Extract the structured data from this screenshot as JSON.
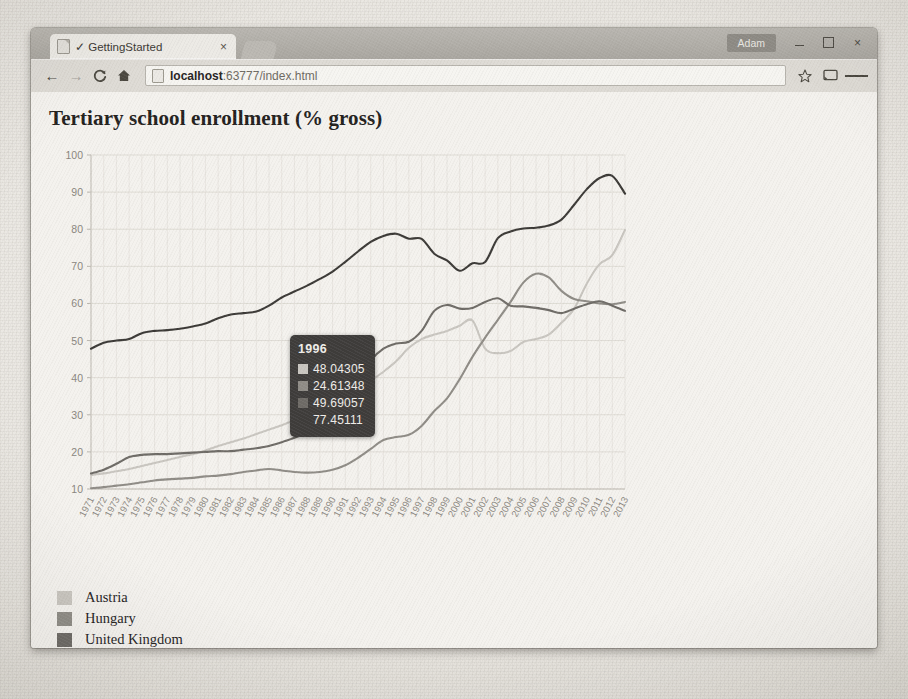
{
  "window": {
    "user_label": "Adam",
    "minimize_label": "minimize",
    "maximize_label": "maximize",
    "close_label": "×"
  },
  "tab": {
    "title": "✓ GettingStarted",
    "close_label": "×"
  },
  "toolbar": {
    "back_label": "←",
    "forward_label": "→",
    "reload_label": "C",
    "home_label": "home",
    "url_prefix": "localhost",
    "url_suffix": ":63777/index.html",
    "url_full": "localhost:63777/index.html",
    "bookmark_label": "☆",
    "cast_label": "cast",
    "menu_label": "menu"
  },
  "chart_data": {
    "type": "line",
    "title": "Tertiary school enrollment (% gross)",
    "xlabel": "",
    "ylabel": "",
    "ylim": [
      10,
      100
    ],
    "yticks": [
      10,
      20,
      30,
      40,
      50,
      60,
      70,
      80,
      90,
      100
    ],
    "grid": true,
    "legend_position": "below-left",
    "x": [
      1971,
      1972,
      1973,
      1974,
      1975,
      1976,
      1977,
      1978,
      1979,
      1980,
      1981,
      1982,
      1983,
      1984,
      1985,
      1986,
      1987,
      1988,
      1989,
      1990,
      1991,
      1992,
      1993,
      1994,
      1995,
      1996,
      1997,
      1998,
      1999,
      2000,
      2001,
      2002,
      2003,
      2004,
      2005,
      2006,
      2007,
      2008,
      2009,
      2010,
      2011,
      2012,
      2013
    ],
    "xticks": [
      "1971",
      "1972",
      "1973",
      "1974",
      "1975",
      "1976",
      "1977",
      "1978",
      "1979",
      "1980",
      "1981",
      "1982",
      "1983",
      "1984",
      "1985",
      "1986",
      "1987",
      "1988",
      "1989",
      "1990",
      "1991",
      "1992",
      "1993",
      "1994",
      "1995",
      "1996",
      "1997",
      "1998",
      "1999",
      "2000",
      "2001",
      "2002",
      "2003",
      "2004",
      "2005",
      "2006",
      "2007",
      "2008",
      "2009",
      "2010",
      "2011",
      "2012",
      "2013"
    ],
    "series": [
      {
        "name": "Austria",
        "color": "#c9c6c0",
        "values": [
          13.8,
          14.2,
          14.8,
          15.4,
          16.2,
          17.0,
          17.8,
          18.6,
          19.4,
          20.4,
          21.6,
          22.6,
          23.6,
          24.8,
          26.0,
          27.2,
          28.6,
          30.2,
          31.6,
          33.2,
          35.0,
          37.0,
          39.2,
          41.6,
          44.4,
          48.04305,
          50.4,
          51.6,
          52.6,
          54.0,
          55.4,
          47.8,
          46.6,
          47.2,
          49.6,
          50.4,
          51.6,
          54.8,
          58.6,
          65.4,
          70.6,
          73.0,
          79.8
        ]
      },
      {
        "name": "Hungary",
        "color": "#8f8c86",
        "values": [
          10.2,
          10.5,
          10.9,
          11.3,
          11.8,
          12.3,
          12.6,
          12.8,
          13.0,
          13.4,
          13.6,
          14.0,
          14.6,
          15.0,
          15.4,
          15.0,
          14.6,
          14.4,
          14.6,
          15.2,
          16.4,
          18.4,
          20.8,
          23.2,
          24.0,
          24.61348,
          27.0,
          31.0,
          34.4,
          39.6,
          45.6,
          50.8,
          55.6,
          60.4,
          65.6,
          68.0,
          67.0,
          63.4,
          61.2,
          60.6,
          60.0,
          59.8,
          60.4
        ]
      },
      {
        "name": "United Kingdom",
        "color": "#6e6b66",
        "values": [
          14.2,
          15.2,
          16.8,
          18.6,
          19.2,
          19.4,
          19.4,
          19.6,
          19.8,
          20.0,
          20.2,
          20.2,
          20.6,
          21.0,
          21.6,
          22.6,
          23.8,
          25.2,
          27.0,
          29.4,
          33.6,
          39.2,
          44.6,
          47.8,
          49.2,
          49.69057,
          52.6,
          58.0,
          59.6,
          58.6,
          58.8,
          60.4,
          61.4,
          59.4,
          59.2,
          58.8,
          58.2,
          57.4,
          58.6,
          59.8,
          60.6,
          59.4,
          58.0
        ]
      },
      {
        "name": "United States",
        "color": "#3b3936",
        "values": [
          47.8,
          49.4,
          50.0,
          50.4,
          52.0,
          52.6,
          52.8,
          53.2,
          53.8,
          54.6,
          56.0,
          57.0,
          57.4,
          57.8,
          59.4,
          61.6,
          63.2,
          64.8,
          66.6,
          68.6,
          71.2,
          74.0,
          76.6,
          78.2,
          78.8,
          77.45111,
          77.4,
          73.4,
          71.6,
          68.8,
          70.8,
          71.2,
          77.6,
          79.4,
          80.2,
          80.4,
          81.0,
          82.6,
          86.6,
          90.8,
          93.8,
          94.4,
          89.6
        ]
      }
    ]
  },
  "tooltip": {
    "year": "1996",
    "rows": [
      {
        "color": "#c9c6c0",
        "value": "48.04305",
        "has_swatch": true
      },
      {
        "color": "#8f8c86",
        "value": "24.61348",
        "has_swatch": true
      },
      {
        "color": "#6e6b66",
        "value": "49.69057",
        "has_swatch": true
      },
      {
        "color": "#3b3936",
        "value": "77.45111",
        "has_swatch": false
      }
    ]
  },
  "ghost_text": [
    {
      "text": "the rate document function to",
      "x": 612,
      "y": 112,
      "size": 15
    },
    {
      "text": "page setting 1 year) 2 Value",
      "x": 600,
      "y": 136,
      "size": 15
    },
    {
      "text": "reChartOverloading",
      "x": 614,
      "y": 262,
      "size": 15
    },
    {
      "text": "Color: false (",
      "x": 622,
      "y": 285,
      "size": 15
    },
    {
      "text": "Date: 2 Cross",
      "x": 618,
      "y": 307,
      "size": 15
    },
    {
      "text": "of 1.2",
      "x": 628,
      "y": 329,
      "size": 15
    },
    {
      "text": "message: funcs  src  link:",
      "x": 596,
      "y": 458,
      "size": 15
    },
    {
      "text": "Forma: added",
      "x": 614,
      "y": 481,
      "size": 15
    },
    {
      "text": "and: shipped,",
      "x": 618,
      "y": 596,
      "size": 15
    },
    {
      "text": "Navy to sec, Fo",
      "x": 614,
      "y": 620,
      "size": 15
    }
  ]
}
